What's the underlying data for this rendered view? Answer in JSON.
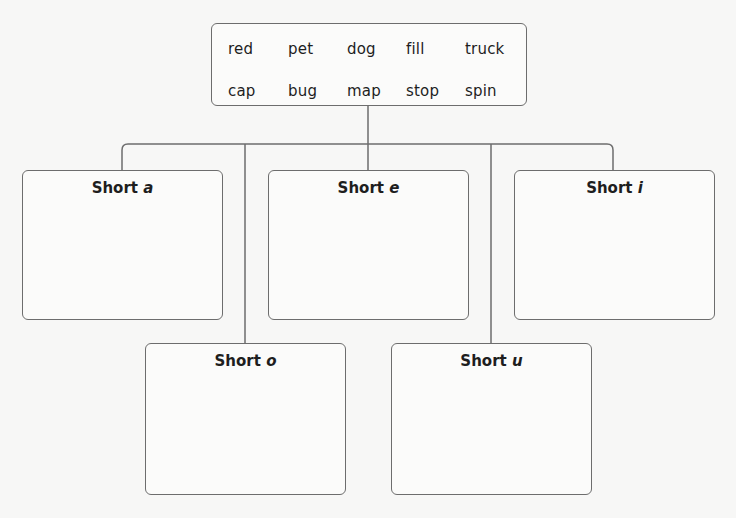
{
  "word_bank": {
    "rows": [
      [
        "red",
        "pet",
        "dog",
        "fill",
        "truck"
      ],
      [
        "cap",
        "bug",
        "map",
        "stop",
        "spin"
      ]
    ]
  },
  "categories": [
    {
      "prefix": "Short",
      "vowel": "a"
    },
    {
      "prefix": "Short",
      "vowel": "e"
    },
    {
      "prefix": "Short",
      "vowel": "i"
    },
    {
      "prefix": "Short",
      "vowel": "o"
    },
    {
      "prefix": "Short",
      "vowel": "u"
    }
  ],
  "colors": {
    "line": "#6d6d6d",
    "background": "#f7f7f6",
    "text": "#1e1e1e"
  }
}
